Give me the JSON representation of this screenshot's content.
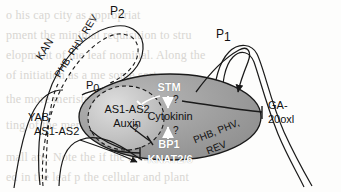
{
  "figure": {
    "type": "diagram",
    "width": 341,
    "height": 192,
    "colors": {
      "meristem_fill": "#9b9b9b",
      "meristem_fill_light": "#b4b4b4",
      "primordium_fill": "#bdbdbd",
      "primordium_fill_light": "#d6d6d6",
      "stroke": "#1a1a1a",
      "white_text": "#ffffff",
      "black_text": "#111111",
      "background": "#fdfdfc",
      "bleedthrough": "#d8d6d2"
    }
  },
  "labels": {
    "p2": "P",
    "p2_sub": "2",
    "p1": "P",
    "p1_sub": "1",
    "p0": "P",
    "p0_sub": "0",
    "kan": "KAN",
    "phb_left": "PHB, PHV, REV",
    "yab": "YAB",
    "as1as2_outer": "AS1-AS2",
    "as1as2_inner": "AS1-AS2",
    "auxin": "Auxin",
    "stm": "STM",
    "cytokinin": "Cytokinin",
    "bp1": "BP1",
    "knat26": "KNAT2/6",
    "phb_right_line1": "PHB, PHV,",
    "phb_right_line2": "REV",
    "ga_line1": "GA-",
    "ga_line2": "20oxl",
    "q_top": "?",
    "q_bottom": "?",
    "q_inner": "?"
  },
  "interactions": [
    {
      "source": "STM",
      "target": "Cytokinin",
      "kind": "activation",
      "annotation": "?"
    },
    {
      "source": "BP1",
      "target": "Cytokinin",
      "kind": "activation",
      "annotation": "?"
    },
    {
      "source": "STM",
      "target": "AS1-AS2",
      "kind": "inhibition"
    },
    {
      "source": "AS1-AS2/Auxin",
      "target": "BP1",
      "kind": "inhibition",
      "annotation": "?"
    },
    {
      "source": "AS1-AS2",
      "target": "KNAT2/6",
      "kind": "inhibition"
    },
    {
      "source": "Cytokinin/STM region",
      "target": "GA-20oxl",
      "kind": "inhibition"
    },
    {
      "source": "meristem",
      "target": "P1",
      "kind": "activation"
    },
    {
      "source": "KNAT2/6 region",
      "target": "leaf base",
      "kind": "activation"
    }
  ],
  "bleedthrough_text": [
    "o his cap city as appropriat",
    "pment  the  minimal requisition to stru",
    "elopment of the leaf  nominal. Along the",
    "of initiation as a me some sort",
    "the more meristem bound out",
    "ting of the meristem",
    "mall are. Note the if the area",
    "ed in the leaf p  the cellular and plant"
  ]
}
